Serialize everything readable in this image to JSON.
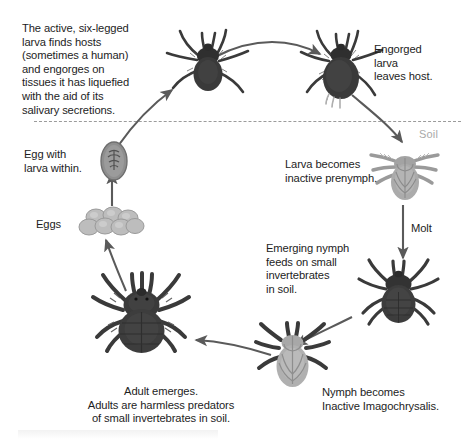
{
  "diagram": {
    "background_color": "#ffffff",
    "text_color": "#1d1d1d",
    "arrow_color": "#5a5a5a",
    "soil_line_color": "#9b9b9b",
    "dark_mite_color": "#3a3a3a",
    "light_mite_color": "#a8a8a8",
    "egg_color": "#b8b8b8"
  },
  "soil": {
    "label": "Soil"
  },
  "labels": {
    "larva_hosts": "The active, six-legged\nlarva finds hosts\n(sometimes a human)\nand engorges on\ntissues it has liquefied\nwith the aid of its\nsalivary secretions.",
    "engorged_larva": "Engorged\nlarva\nleaves host.",
    "larva_prenymph": "Larva becomes\ninactive prenymph.",
    "molt": "Molt",
    "emerging_nymph": "Emerging nymph\nfeeds on small\ninvertebrates\nin soil.",
    "nymph_imagochrysalis": "Nymph becomes\nInactive Imagochrysalis.",
    "adult_emerges": "Adult emerges.\nAdults are harmless predators\nof small invertebrates in soil.",
    "egg_with_larva": "Egg with\nlarva within.",
    "eggs": "Eggs"
  },
  "stages": [
    {
      "name": "active-larva",
      "label_key": "larva_hosts",
      "color": "#3a3a3a"
    },
    {
      "name": "engorged-larva",
      "label_key": "engorged_larva",
      "color": "#3a3a3a"
    },
    {
      "name": "prenymph",
      "label_key": "larva_prenymph",
      "color": "#a8a8a8"
    },
    {
      "name": "nymph",
      "label_key": "emerging_nymph",
      "color": "#3a3a3a"
    },
    {
      "name": "imagochrysalis",
      "label_key": "nymph_imagochrysalis",
      "color": "#a8a8a8"
    },
    {
      "name": "adult",
      "label_key": "adult_emerges",
      "color": "#3a3a3a"
    },
    {
      "name": "egg-with-larva",
      "label_key": "egg_with_larva",
      "color": "#8e8e8e"
    },
    {
      "name": "eggs",
      "label_key": "eggs",
      "color": "#b8b8b8"
    }
  ]
}
